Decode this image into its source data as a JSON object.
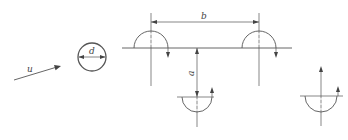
{
  "diagram": {
    "type": "engineering-schematic",
    "colors": {
      "stroke": "#555555",
      "label": "#444444",
      "background": "#ffffff"
    },
    "labels": {
      "flow_velocity": "u",
      "diameter": "d",
      "horizontal_spacing": "b",
      "vertical_spacing": "a"
    },
    "elements": [
      {
        "id": "flow-arrow",
        "kind": "arrow",
        "label": "u",
        "from": [
          14,
          80
        ],
        "to": [
          61,
          66
        ]
      },
      {
        "id": "cylinder",
        "kind": "circle",
        "center": [
          92,
          57
        ],
        "radius": 14,
        "label": "d"
      },
      {
        "id": "baseline",
        "kind": "line",
        "from": [
          122,
          48
        ],
        "to": [
          292,
          48
        ]
      },
      {
        "id": "half-cylinder-upper-left",
        "kind": "semicircle-up",
        "center": [
          151,
          48
        ],
        "radius": 17,
        "rotation_arrow": "down-right"
      },
      {
        "id": "half-cylinder-upper-right",
        "kind": "semicircle-up",
        "center": [
          259,
          48
        ],
        "radius": 17,
        "rotation_arrow": "down-right"
      },
      {
        "id": "half-cylinder-lower-middle",
        "kind": "semicircle-down",
        "center": [
          197,
          97
        ],
        "radius": 15,
        "rotation_arrow": "up-right"
      },
      {
        "id": "half-cylinder-lower-right",
        "kind": "semicircle-down",
        "center": [
          321,
          96
        ],
        "radius": 16,
        "rotation_arrow": "up-right",
        "axis_arrow": "up"
      },
      {
        "id": "dim-b",
        "kind": "dimension-horizontal",
        "label": "b",
        "from": [
          151,
          22
        ],
        "to": [
          259,
          22
        ]
      },
      {
        "id": "dim-a",
        "kind": "dimension-vertical",
        "label": "a",
        "from": [
          197,
          48
        ],
        "to": [
          197,
          97
        ]
      }
    ]
  }
}
